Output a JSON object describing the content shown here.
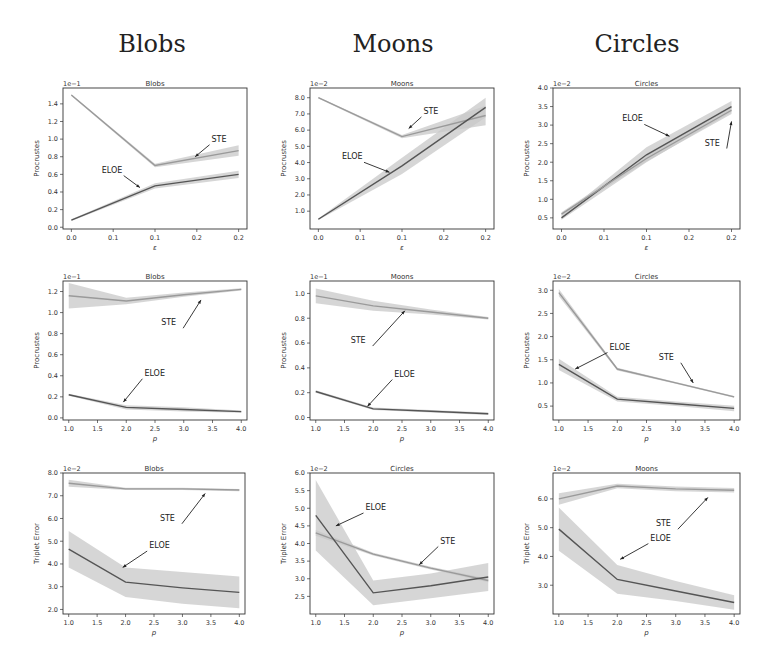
{
  "column_headers": [
    {
      "label": "Blobs",
      "x": 152
    },
    {
      "label": "Moons",
      "x": 393
    },
    {
      "label": "Circles",
      "x": 637
    }
  ],
  "colors": {
    "eloe_line": "#555555",
    "ste_line": "#9a9a9a",
    "band": "#c8c8c8",
    "axes": "#333333",
    "text": "#333333"
  },
  "chart_data": [
    {
      "type": "line",
      "row": 0,
      "col": 0,
      "title": "Blobs",
      "offset_label": "1e−1",
      "xlabel": "ε",
      "ylabel": "Procrustes",
      "box": [
        63,
        88,
        247,
        229
      ],
      "xlim": [
        -0.01,
        0.21
      ],
      "ylim": [
        -0.02,
        1.58
      ],
      "xticks": [
        0.0,
        0.05,
        0.1,
        0.15,
        0.2
      ],
      "xticklabels": [
        "0.0",
        "0.1",
        "0.1",
        "0.2",
        "0.2"
      ],
      "yticks": [
        0.0,
        0.2,
        0.4,
        0.6,
        0.8,
        1.0,
        1.2,
        1.4
      ],
      "yticklabels": [
        "0.0",
        "0.2",
        "0.4",
        "0.6",
        "0.8",
        "1.0",
        "1.2",
        "1.4"
      ],
      "x": [
        0.0,
        0.1,
        0.2
      ],
      "series": [
        {
          "name": "STE",
          "values": [
            1.5,
            0.7,
            0.87
          ],
          "band": [
            0.01,
            0.02,
            0.06
          ]
        },
        {
          "name": "ELOE",
          "values": [
            0.08,
            0.47,
            0.6
          ],
          "band": [
            0.01,
            0.03,
            0.04
          ]
        }
      ],
      "annotations": [
        {
          "text": "STE",
          "tx": 0.17,
          "ty": 0.97,
          "ax": 0.148,
          "ay": 0.8
        },
        {
          "text": "ELOE",
          "tx": 0.053,
          "ty": 0.62,
          "ax": 0.082,
          "ay": 0.45
        }
      ]
    },
    {
      "type": "line",
      "row": 0,
      "col": 1,
      "title": "Moons",
      "offset_label": "1e−2",
      "xlabel": "ε",
      "ylabel": "Procrustes",
      "box": [
        310,
        88,
        494,
        229
      ],
      "xlim": [
        -0.01,
        0.21
      ],
      "ylim": [
        -0.1,
        8.6
      ],
      "xticks": [
        0.0,
        0.05,
        0.1,
        0.15,
        0.2
      ],
      "xticklabels": [
        "0.0",
        "0.1",
        "0.1",
        "0.2",
        "0.2"
      ],
      "yticks": [
        1.0,
        2.0,
        3.0,
        4.0,
        5.0,
        6.0,
        7.0,
        8.0
      ],
      "yticklabels": [
        "1.0",
        "2.0",
        "3.0",
        "4.0",
        "5.0",
        "6.0",
        "7.0",
        "8.0"
      ],
      "x": [
        0.0,
        0.1,
        0.2
      ],
      "series": [
        {
          "name": "STE",
          "values": [
            8.0,
            5.6,
            6.9
          ],
          "band": [
            0.05,
            0.1,
            0.6
          ]
        },
        {
          "name": "ELOE",
          "values": [
            0.5,
            3.8,
            7.4
          ],
          "band": [
            0.05,
            0.5,
            0.6
          ]
        }
      ],
      "annotations": [
        {
          "text": "STE",
          "tx": 0.128,
          "ty": 7.0,
          "ax": 0.108,
          "ay": 6.1
        },
        {
          "text": "ELOE",
          "tx": 0.045,
          "ty": 4.2,
          "ax": 0.085,
          "ay": 3.4
        }
      ]
    },
    {
      "type": "line",
      "row": 0,
      "col": 2,
      "title": "Circles",
      "offset_label": "1e−2",
      "xlabel": "ε",
      "ylabel": "Procrustes",
      "box": [
        553,
        88,
        740,
        229
      ],
      "xlim": [
        -0.01,
        0.21
      ],
      "ylim": [
        0.2,
        4.0
      ],
      "xticks": [
        0.0,
        0.05,
        0.1,
        0.15,
        0.2
      ],
      "xticklabels": [
        "0.0",
        "0.1",
        "0.1",
        "0.2",
        "0.2"
      ],
      "yticks": [
        0.5,
        1.0,
        1.5,
        2.0,
        2.5,
        3.0,
        3.5,
        4.0
      ],
      "yticklabels": [
        "0.5",
        "1.0",
        "1.5",
        "2.0",
        "2.5",
        "3.0",
        "3.5",
        "4.0"
      ],
      "x": [
        0.0,
        0.1,
        0.2
      ],
      "series": [
        {
          "name": "ELOE",
          "values": [
            0.5,
            2.2,
            3.5
          ],
          "band": [
            0.05,
            0.2,
            0.15
          ]
        },
        {
          "name": "STE",
          "values": [
            0.6,
            2.1,
            3.4
          ],
          "band": [
            0.05,
            0.08,
            0.1
          ]
        }
      ],
      "annotations": [
        {
          "text": "ELOE",
          "tx": 0.088,
          "ty": 3.1,
          "ax": 0.127,
          "ay": 2.7
        },
        {
          "text": "STE",
          "tx": 0.185,
          "ty": 2.45,
          "ax": 0.2,
          "ay": 3.1
        }
      ]
    },
    {
      "type": "line",
      "row": 1,
      "col": 0,
      "title": "Blobs",
      "offset_label": "1e−1",
      "xlabel": "p",
      "ylabel": "Procrustes",
      "box": [
        63,
        281,
        247,
        420
      ],
      "xlim": [
        0.9,
        4.1
      ],
      "ylim": [
        -0.02,
        1.3
      ],
      "xticks": [
        1.0,
        1.5,
        2.0,
        2.5,
        3.0,
        3.5,
        4.0
      ],
      "xticklabels": [
        "1.0",
        "1.5",
        "2.0",
        "2.5",
        "3.0",
        "3.5",
        "4.0"
      ],
      "yticks": [
        0.0,
        0.2,
        0.4,
        0.6,
        0.8,
        1.0,
        1.2
      ],
      "yticklabels": [
        "0.0",
        "0.2",
        "0.4",
        "0.6",
        "0.8",
        "1.0",
        "1.2"
      ],
      "x": [
        1.0,
        2.0,
        3.0,
        4.0
      ],
      "series": [
        {
          "name": "STE",
          "values": [
            1.16,
            1.11,
            1.17,
            1.22
          ],
          "band": [
            0.12,
            0.03,
            0.02,
            0.01
          ]
        },
        {
          "name": "ELOE",
          "values": [
            0.22,
            0.1,
            0.08,
            0.06
          ],
          "band": [
            0.01,
            0.02,
            0.02,
            0.01
          ]
        }
      ],
      "annotations": [
        {
          "text": "STE",
          "tx": 2.85,
          "ty": 0.88,
          "ax": 3.3,
          "ay": 1.12
        },
        {
          "text": "ELOE",
          "tx": 2.35,
          "ty": 0.4,
          "ax": 1.95,
          "ay": 0.15
        }
      ]
    },
    {
      "type": "line",
      "row": 1,
      "col": 1,
      "title": "Moons",
      "offset_label": "1e−1",
      "xlabel": "p",
      "ylabel": "Procrustes",
      "box": [
        310,
        281,
        494,
        420
      ],
      "xlim": [
        0.9,
        4.1
      ],
      "ylim": [
        -0.02,
        1.1
      ],
      "xticks": [
        1.0,
        1.5,
        2.0,
        2.5,
        3.0,
        3.5,
        4.0
      ],
      "xticklabels": [
        "1.0",
        "1.5",
        "2.0",
        "2.5",
        "3.0",
        "3.5",
        "4.0"
      ],
      "yticks": [
        0.0,
        0.2,
        0.4,
        0.6,
        0.8,
        1.0
      ],
      "yticklabels": [
        "0.0",
        "0.2",
        "0.4",
        "0.6",
        "0.8",
        "1.0"
      ],
      "x": [
        1.0,
        2.0,
        3.0,
        4.0
      ],
      "series": [
        {
          "name": "STE",
          "values": [
            0.98,
            0.9,
            0.85,
            0.8
          ],
          "band": [
            0.06,
            0.04,
            0.02,
            0.01
          ]
        },
        {
          "name": "ELOE",
          "values": [
            0.21,
            0.07,
            0.05,
            0.03
          ],
          "band": [
            0.01,
            0.01,
            0.01,
            0.01
          ]
        }
      ],
      "annotations": [
        {
          "text": "STE",
          "tx": 1.85,
          "ty": 0.6,
          "ax": 2.55,
          "ay": 0.86
        },
        {
          "text": "ELOE",
          "tx": 2.4,
          "ty": 0.33,
          "ax": 1.9,
          "ay": 0.09
        }
      ]
    },
    {
      "type": "line",
      "row": 1,
      "col": 2,
      "title": "Circles",
      "offset_label": "1e−2",
      "xlabel": "p",
      "ylabel": "Procrustes",
      "box": [
        553,
        281,
        740,
        420
      ],
      "xlim": [
        0.9,
        4.1
      ],
      "ylim": [
        0.2,
        3.2
      ],
      "xticks": [
        1.0,
        1.5,
        2.0,
        2.5,
        3.0,
        3.5,
        4.0
      ],
      "xticklabels": [
        "1.0",
        "1.5",
        "2.0",
        "2.5",
        "3.0",
        "3.5",
        "4.0"
      ],
      "yticks": [
        0.5,
        1.0,
        1.5,
        2.0,
        2.5,
        3.0
      ],
      "yticklabels": [
        "0.5",
        "1.0",
        "1.5",
        "2.0",
        "2.5",
        "3.0"
      ],
      "x": [
        1.0,
        2.0,
        3.0,
        4.0
      ],
      "series": [
        {
          "name": "STE",
          "values": [
            2.95,
            1.3,
            1.0,
            0.7
          ],
          "band": [
            0.08,
            0.03,
            0.02,
            0.02
          ]
        },
        {
          "name": "ELOE",
          "values": [
            1.4,
            0.65,
            0.55,
            0.45
          ],
          "band": [
            0.12,
            0.05,
            0.05,
            0.06
          ]
        }
      ],
      "annotations": [
        {
          "text": "ELOE",
          "tx": 1.9,
          "ty": 1.72,
          "ax": 1.28,
          "ay": 1.3
        },
        {
          "text": "STE",
          "tx": 2.95,
          "ty": 1.5,
          "ax": 3.3,
          "ay": 1.0
        }
      ]
    },
    {
      "type": "line",
      "row": 2,
      "col": 0,
      "title": "Blobs",
      "offset_label": "1e−2",
      "xlabel": "p",
      "ylabel": "Triplet Error",
      "box": [
        63,
        473,
        245,
        614
      ],
      "xlim": [
        0.9,
        4.1
      ],
      "ylim": [
        1.8,
        8.0
      ],
      "xticks": [
        1.0,
        1.5,
        2.0,
        2.5,
        3.0,
        3.5,
        4.0
      ],
      "xticklabels": [
        "1.0",
        "1.5",
        "2.0",
        "2.5",
        "3.0",
        "3.5",
        "4.0"
      ],
      "yticks": [
        2.0,
        3.0,
        4.0,
        5.0,
        6.0,
        7.0,
        8.0
      ],
      "yticklabels": [
        "2.0",
        "3.0",
        "4.0",
        "5.0",
        "6.0",
        "7.0",
        "8.0"
      ],
      "x": [
        1.0,
        2.0,
        3.0,
        4.0
      ],
      "series": [
        {
          "name": "STE",
          "values": [
            7.55,
            7.3,
            7.3,
            7.25
          ],
          "band": [
            0.15,
            0.05,
            0.05,
            0.05
          ]
        },
        {
          "name": "ELOE",
          "values": [
            4.65,
            3.2,
            2.95,
            2.75
          ],
          "band": [
            0.8,
            0.65,
            0.7,
            0.7
          ]
        }
      ],
      "annotations": [
        {
          "text": "STE",
          "tx": 2.85,
          "ty": 5.9,
          "ax": 3.4,
          "ay": 7.1
        },
        {
          "text": "ELOE",
          "tx": 2.45,
          "ty": 4.7,
          "ax": 1.95,
          "ay": 3.85
        }
      ]
    },
    {
      "type": "line",
      "row": 2,
      "col": 1,
      "title": "Circles",
      "offset_label": "1e−2",
      "xlabel": "p",
      "ylabel": "Triplet Error",
      "box": [
        310,
        473,
        494,
        614
      ],
      "xlim": [
        0.9,
        4.1
      ],
      "ylim": [
        2.0,
        6.0
      ],
      "xticks": [
        1.0,
        1.5,
        2.0,
        2.5,
        3.0,
        3.5,
        4.0
      ],
      "xticklabels": [
        "1.0",
        "1.5",
        "2.0",
        "2.5",
        "3.0",
        "3.5",
        "4.0"
      ],
      "yticks": [
        2.5,
        3.0,
        3.5,
        4.0,
        4.5,
        5.0,
        5.5,
        6.0
      ],
      "yticklabels": [
        "2.5",
        "3.0",
        "3.5",
        "4.0",
        "4.5",
        "5.0",
        "5.5",
        "6.0"
      ],
      "x": [
        1.0,
        2.0,
        3.0,
        4.0
      ],
      "series": [
        {
          "name": "STE",
          "values": [
            4.3,
            3.7,
            3.3,
            2.95
          ],
          "band": [
            0.08,
            0.04,
            0.04,
            0.05
          ]
        },
        {
          "name": "ELOE",
          "values": [
            4.8,
            2.6,
            2.8,
            3.05
          ],
          "band": [
            1.0,
            0.35,
            0.35,
            0.4
          ]
        }
      ],
      "annotations": [
        {
          "text": "ELOE",
          "tx": 1.9,
          "ty": 4.95,
          "ax": 1.35,
          "ay": 4.5
        },
        {
          "text": "STE",
          "tx": 3.2,
          "ty": 4.0,
          "ax": 2.8,
          "ay": 3.4
        }
      ]
    },
    {
      "type": "line",
      "row": 2,
      "col": 2,
      "title": "Moons",
      "offset_label": "1e−2",
      "xlabel": "p",
      "ylabel": "Triplet Error",
      "box": [
        553,
        473,
        740,
        614
      ],
      "xlim": [
        0.9,
        4.1
      ],
      "ylim": [
        2.0,
        6.9
      ],
      "xticks": [
        1.0,
        1.5,
        2.0,
        2.5,
        3.0,
        3.5,
        4.0
      ],
      "xticklabels": [
        "1.0",
        "1.5",
        "2.0",
        "2.5",
        "3.0",
        "3.5",
        "4.0"
      ],
      "yticks": [
        3.0,
        4.0,
        5.0,
        6.0
      ],
      "yticklabels": [
        "3.0",
        "4.0",
        "5.0",
        "6.0"
      ],
      "x": [
        1.0,
        2.0,
        3.0,
        4.0
      ],
      "series": [
        {
          "name": "STE",
          "values": [
            6.0,
            6.45,
            6.35,
            6.3
          ],
          "band": [
            0.2,
            0.08,
            0.08,
            0.08
          ]
        },
        {
          "name": "ELOE",
          "values": [
            4.95,
            3.2,
            2.8,
            2.4
          ],
          "band": [
            0.75,
            0.5,
            0.35,
            0.25
          ]
        }
      ],
      "annotations": [
        {
          "text": "STE",
          "tx": 2.9,
          "ty": 5.05,
          "ax": 3.55,
          "ay": 6.05
        },
        {
          "text": "ELOE",
          "tx": 2.6,
          "ty": 4.55,
          "ax": 2.05,
          "ay": 3.9
        }
      ]
    }
  ]
}
